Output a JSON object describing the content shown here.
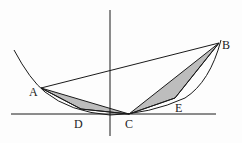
{
  "diagram": {
    "type": "geometry",
    "colors": {
      "stroke": "#1a1a1a",
      "shade": "#bdbdbd",
      "background": "#fdfdfd"
    },
    "points": {
      "A": {
        "label": "A",
        "x": 41,
        "y": 88
      },
      "B": {
        "label": "B",
        "x": 219,
        "y": 43
      },
      "C": {
        "label": "C",
        "x": 129,
        "y": 114
      },
      "D": {
        "label": "D",
        "x": 81,
        "y": 109
      },
      "E": {
        "label": "E",
        "x": 175,
        "y": 98
      }
    },
    "labels": {
      "A": "A",
      "B": "B",
      "C": "C",
      "D": "D",
      "E": "E"
    }
  }
}
